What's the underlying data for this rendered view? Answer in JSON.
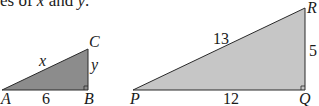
{
  "caption": {
    "prefix": "es of ",
    "var1": "x",
    "mid": " and ",
    "var2": "y",
    "suffix": "."
  },
  "triangle_left": {
    "fill": "#8c8c8c",
    "vertices": {
      "A": "A",
      "B": "B",
      "C": "C"
    },
    "sides": {
      "AB": "6",
      "AC": "x",
      "BC": "y"
    },
    "right_angle_at": "B"
  },
  "triangle_right": {
    "fill": "#c6c6c6",
    "vertices": {
      "P": "P",
      "Q": "Q",
      "R": "R"
    },
    "sides": {
      "PQ": "12",
      "PR": "13",
      "QR": "5"
    },
    "right_angle_at": "Q"
  }
}
